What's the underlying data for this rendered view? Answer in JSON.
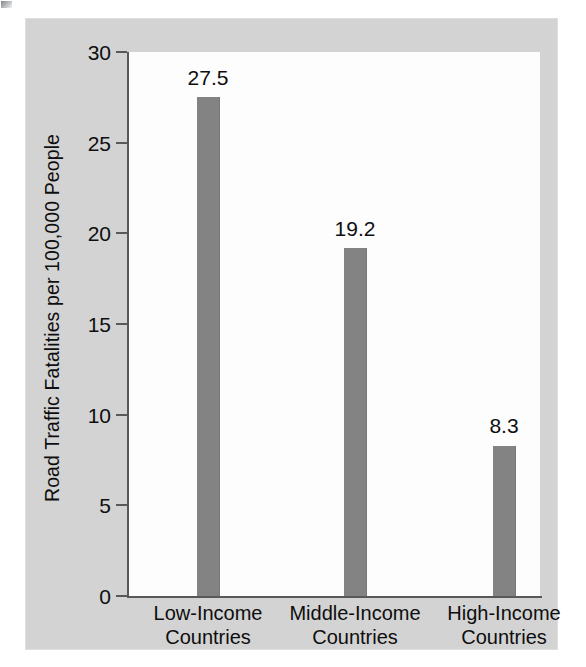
{
  "chart_data": {
    "type": "bar",
    "title": "",
    "xlabel": "",
    "ylabel": "Road Traffic Fatalities per 100,000 People",
    "categories": [
      "Low-Income\nCountries",
      "Middle-Income\nCountries",
      "High-Income\nCountries"
    ],
    "category_lines": [
      [
        "Low-Income",
        "Countries"
      ],
      [
        "Middle-Income",
        "Countries"
      ],
      [
        "High-Income",
        "Countries"
      ]
    ],
    "values": [
      27.5,
      19.2,
      8.3
    ],
    "value_labels": [
      "27.5",
      "19.2",
      "8.3"
    ],
    "ylim": [
      0,
      30
    ],
    "yticks": [
      0,
      5,
      10,
      15,
      20,
      25,
      30
    ],
    "ytick_labels": [
      "0",
      "5",
      "10",
      "15",
      "20",
      "25",
      "30"
    ],
    "grid": false,
    "legend": false,
    "bar_color": "#838383",
    "plot_background": "#fdfdfd",
    "figure_background": "#d3d3d3",
    "axis_color": "#585858",
    "text_color": "#0e0e0e"
  }
}
